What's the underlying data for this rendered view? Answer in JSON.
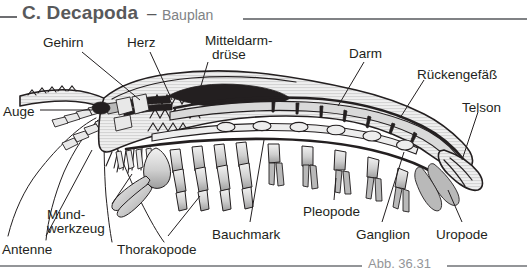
{
  "header": {
    "title": "C. Decapoda",
    "dash": "–",
    "subtitle": "Bauplan"
  },
  "footer": {
    "caption": "Abb. 36.31"
  },
  "diagram": {
    "labels": [
      {
        "id": "gehirn",
        "text": "Gehirn",
        "x": 43,
        "y": 36
      },
      {
        "id": "herz",
        "text": "Herz",
        "x": 127,
        "y": 36
      },
      {
        "id": "mitteldarmdruse",
        "text": "Mitteldarm-",
        "x": 205,
        "y": 34
      },
      {
        "id": "mitteldarmdruse2",
        "text": "drüse",
        "x": 212,
        "y": 48
      },
      {
        "id": "darm",
        "text": "Darm",
        "x": 349,
        "y": 47
      },
      {
        "id": "ruckengefass",
        "text": "Rückengefäß",
        "x": 417,
        "y": 68
      },
      {
        "id": "telson",
        "text": "Telson",
        "x": 462,
        "y": 101
      },
      {
        "id": "auge",
        "text": "Auge",
        "x": 3,
        "y": 105
      },
      {
        "id": "mundwerkzeug",
        "text": "Mund-",
        "x": 47,
        "y": 208
      },
      {
        "id": "mundwerkzeug2",
        "text": "werkzeug",
        "x": 47,
        "y": 222
      },
      {
        "id": "antenne",
        "text": "Antenne",
        "x": 2,
        "y": 243
      },
      {
        "id": "thorakopode",
        "text": "Thorakopode",
        "x": 117,
        "y": 243
      },
      {
        "id": "bauchmark",
        "text": "Bauchmark",
        "x": 212,
        "y": 228
      },
      {
        "id": "pleopode",
        "text": "Pleopode",
        "x": 303,
        "y": 205
      },
      {
        "id": "ganglion",
        "text": "Ganglion",
        "x": 356,
        "y": 228
      },
      {
        "id": "uropode",
        "text": "Uropode",
        "x": 436,
        "y": 228
      }
    ],
    "colors": {
      "ink": "#231f20",
      "header_title": "#58595b",
      "header_sub": "#808285",
      "rule": "#808285",
      "caption": "#939598",
      "body_fill": "#ebebeb",
      "organ_dark": "#231f20",
      "limb_mid": "#b9b9b9"
    }
  }
}
